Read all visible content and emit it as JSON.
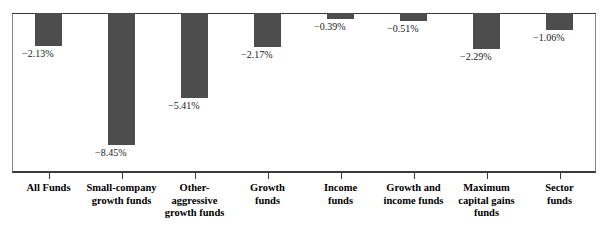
{
  "chart_data": {
    "type": "bar",
    "title": "",
    "subtitle": "",
    "xlabel": "",
    "ylabel": "",
    "grid": false,
    "legend": "none",
    "orientation": "vertical",
    "ylim": [
      -9.0,
      0.0
    ],
    "axis_note": "zero line at top of plot; all values negative, bars hang downward",
    "categories": [
      "All Funds",
      "Small-company\ngrowth funds",
      "Other-\naggressive\ngrowth funds",
      "Growth\nfunds",
      "Income\nfunds",
      "Growth and\nincome funds",
      "Maximum\ncapital gains\nfunds",
      "Sector\nfunds"
    ],
    "values": [
      -2.13,
      -8.45,
      -5.41,
      -2.17,
      -0.39,
      -0.51,
      -2.29,
      -1.06
    ],
    "value_labels": [
      "−2.13%",
      "−8.45%",
      "−5.41%",
      "−2.17%",
      "−0.39%",
      "−0.51%",
      "−2.29%",
      "−1.06%"
    ],
    "bar_color": "#4d4d4d",
    "axis_color": "#3a3a3a",
    "text_color": "#000000",
    "background": "#ffffff"
  }
}
